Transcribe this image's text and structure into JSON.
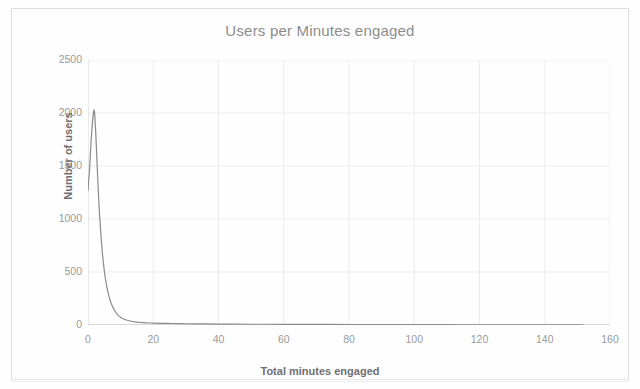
{
  "chart_data": {
    "type": "line",
    "title": "Users per Minutes engaged",
    "xlabel": "Total minutes engaged",
    "ylabel": "Number of users",
    "xlim": [
      0,
      160
    ],
    "ylim": [
      0,
      2500
    ],
    "xticks": [
      0,
      20,
      40,
      60,
      80,
      100,
      120,
      140,
      160
    ],
    "yticks": [
      0,
      500,
      1000,
      1500,
      2000,
      2500
    ],
    "xtick_labels": [
      "0",
      "20",
      "40",
      "60",
      "80",
      "100",
      "120",
      "140",
      "160"
    ],
    "ytick_labels": [
      "0",
      "500",
      "1000",
      "1500",
      "2000",
      "2500"
    ],
    "grid": true,
    "legend": null,
    "line_color": "#8a8a8a",
    "series": [
      {
        "name": "Users",
        "x": [
          0,
          0.5,
          1,
          1.4,
          1.8,
          2,
          2.4,
          3,
          3.5,
          4,
          4.5,
          5,
          5.5,
          6,
          6.5,
          7,
          7.5,
          8,
          8.5,
          9,
          9.5,
          10,
          10.5,
          11,
          12,
          13,
          14,
          15,
          16,
          17,
          18,
          19,
          20,
          22,
          24,
          26,
          28,
          30,
          33,
          36,
          40,
          45,
          50,
          55,
          60,
          65,
          70,
          75,
          80,
          85,
          90,
          95,
          100,
          105,
          110,
          115,
          120,
          125,
          130,
          135,
          140,
          145,
          150,
          152
        ],
        "y": [
          1270,
          1480,
          1760,
          1930,
          2030,
          2010,
          1800,
          1360,
          1060,
          830,
          650,
          510,
          405,
          325,
          262,
          212,
          175,
          145,
          120,
          100,
          84,
          72,
          63,
          56,
          45,
          38,
          32,
          27,
          24,
          22,
          20,
          19,
          18,
          16,
          15,
          14,
          13,
          12,
          11,
          10,
          9,
          8,
          7,
          7,
          6,
          6,
          5,
          5,
          4,
          4,
          4,
          3,
          3,
          3,
          3,
          2,
          2,
          2,
          2,
          2,
          1,
          1,
          1,
          0
        ]
      }
    ],
    "annotations": {
      "peak_value": 2030,
      "peak_x": 1.8,
      "start_value": 1270,
      "max_x_data": 152
    }
  },
  "page": {
    "border_color": "#dedede",
    "background": "#ffffff",
    "grid_color": "#ececec",
    "axis_color": "#b5b5b5",
    "tick_text_color": "#9a9a9a",
    "title_color": "#8d8d8d",
    "axis_label_color": "#6f6f6f"
  }
}
